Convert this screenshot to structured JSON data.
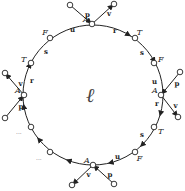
{
  "diagram": {
    "center_label": "ℓ",
    "hub_label": "A",
    "ellipsis": "...",
    "colors": {
      "line": "#222222",
      "node_fill": "#ffffff",
      "text": "#222222"
    },
    "hubs": [
      {
        "id": "top",
        "x": 92,
        "y": 24,
        "spokes": [
          {
            "label": "p",
            "x": 70,
            "y": 5
          },
          {
            "label": "v",
            "x": 114,
            "y": 4
          }
        ]
      },
      {
        "id": "right",
        "x": 161,
        "y": 95,
        "spokes": [
          {
            "label": "p",
            "x": 180,
            "y": 72
          },
          {
            "label": "v",
            "x": 178,
            "y": 117
          }
        ]
      },
      {
        "id": "bottom",
        "x": 93,
        "y": 165,
        "spokes": [
          {
            "label": "v",
            "x": 72,
            "y": 185
          },
          {
            "label": "p",
            "x": 114,
            "y": 184
          }
        ]
      },
      {
        "id": "left",
        "x": 24,
        "y": 95,
        "spokes": [
          {
            "label": "v",
            "x": 5,
            "y": 73
          },
          {
            "label": "p",
            "x": 5,
            "y": 118
          }
        ]
      }
    ],
    "arc_nodes": [
      {
        "label": "F",
        "x": 50,
        "y": 38
      },
      {
        "label": "T",
        "x": 31,
        "y": 63
      },
      {
        "label": "T",
        "x": 135,
        "y": 38
      },
      {
        "label": "F",
        "x": 154,
        "y": 63
      },
      {
        "label": "T",
        "x": 154,
        "y": 127
      },
      {
        "label": "F",
        "x": 135,
        "y": 152
      },
      {
        "label": "",
        "x": 31,
        "y": 127
      },
      {
        "label": "",
        "x": 50,
        "y": 152
      }
    ],
    "edge_labels": [
      {
        "text": "u",
        "x": 70,
        "y": 32
      },
      {
        "text": "s",
        "x": 44,
        "y": 54
      },
      {
        "text": "r",
        "x": 30,
        "y": 83
      },
      {
        "text": "r",
        "x": 113,
        "y": 33
      },
      {
        "text": "s",
        "x": 140,
        "y": 55
      },
      {
        "text": "u",
        "x": 152,
        "y": 84
      },
      {
        "text": "r",
        "x": 155,
        "y": 106
      },
      {
        "text": "s",
        "x": 140,
        "y": 137
      },
      {
        "text": "u",
        "x": 115,
        "y": 159
      }
    ]
  }
}
